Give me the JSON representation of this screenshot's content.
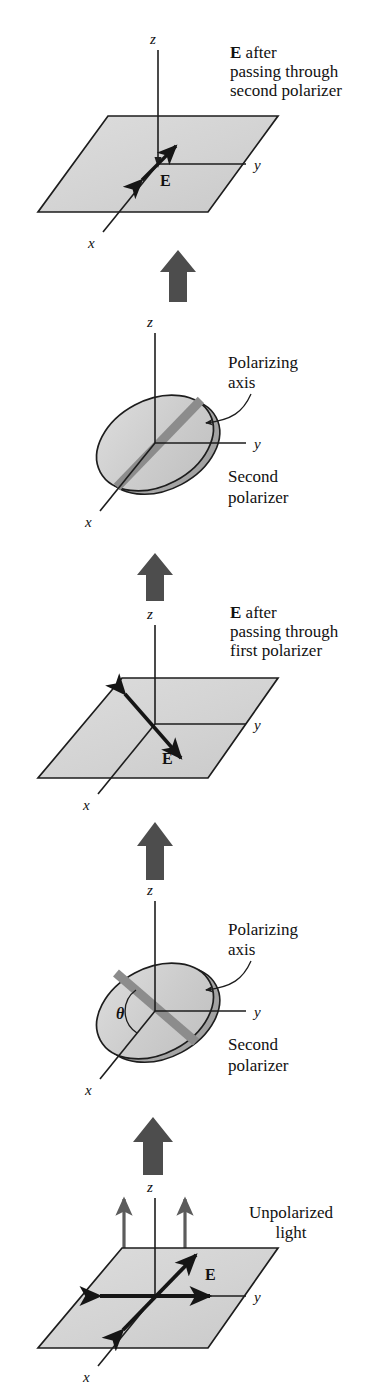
{
  "figure": {
    "background_color": "#ffffff",
    "plane_fill_color": "#d4d4d4",
    "disk_fill_color": "#cfcfcf",
    "polarizing_band_color": "#8c8c8c",
    "block_arrow_color": "#4d4d4d",
    "unpolarized_ray_color": "#5c5c5c",
    "ink_color": "#1d1d1d"
  },
  "labels": {
    "axis_x": "x",
    "axis_y": "y",
    "axis_z": "z",
    "e_field": "E",
    "theta": "θ"
  },
  "panels": [
    {
      "id": "panel-e-after-second-polarizer",
      "kind": "plane",
      "order": 1,
      "caption_bold_lead": "E",
      "caption_lines": [
        " after",
        "passing through",
        "second polarizer"
      ],
      "e_label": "E",
      "e_vector_description": "short double-headed arrow along x axis",
      "axes": [
        "x",
        "y",
        "z"
      ]
    },
    {
      "id": "panel-second-polarizer-upper",
      "kind": "disk",
      "order": 2,
      "annotation_polarizing_axis": [
        "Polarizing",
        "axis"
      ],
      "annotation_polarizer": [
        "Second",
        "polarizer"
      ],
      "shows_theta": false,
      "band_description": "polarizing axis band tilted from lower-left to upper-right",
      "axes": [
        "x",
        "y",
        "z"
      ]
    },
    {
      "id": "panel-e-after-first-polarizer",
      "kind": "plane",
      "order": 3,
      "caption_bold_lead": "E",
      "caption_lines": [
        " after",
        "passing through",
        "first polarizer"
      ],
      "e_label": "E",
      "e_vector_description": "long double-headed arrow tilted up-left to down-right",
      "axes": [
        "x",
        "y",
        "z"
      ]
    },
    {
      "id": "panel-second-polarizer-lower",
      "kind": "disk",
      "order": 4,
      "annotation_polarizing_axis": [
        "Polarizing",
        "axis"
      ],
      "annotation_polarizer": [
        "Second",
        "polarizer"
      ],
      "shows_theta": true,
      "theta_label": "θ",
      "band_description": "polarizing axis band tilted from upper-left to lower-right, angle theta measured from y axis",
      "axes": [
        "x",
        "y",
        "z"
      ]
    },
    {
      "id": "panel-unpolarized-light",
      "kind": "plane",
      "order": 5,
      "annotation_light": [
        "Unpolarized",
        "light"
      ],
      "e_label": "E",
      "e_vector_description": "two crossed double-headed arrows in the plane",
      "axes": [
        "x",
        "y",
        "z"
      ]
    }
  ],
  "flow_arrows": [
    {
      "id": "flow-arrow-1",
      "between": [
        "panel-second-polarizer-upper",
        "panel-e-after-second-polarizer"
      ],
      "direction": "up"
    },
    {
      "id": "flow-arrow-2",
      "between": [
        "panel-e-after-first-polarizer",
        "panel-second-polarizer-upper"
      ],
      "direction": "up"
    },
    {
      "id": "flow-arrow-3",
      "between": [
        "panel-second-polarizer-lower",
        "panel-e-after-first-polarizer"
      ],
      "direction": "up"
    },
    {
      "id": "flow-arrow-4",
      "between": [
        "panel-unpolarized-light",
        "panel-second-polarizer-lower"
      ],
      "direction": "up"
    }
  ]
}
